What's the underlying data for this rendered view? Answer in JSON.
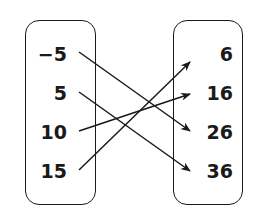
{
  "diagram": {
    "type": "mapping-diagram",
    "domain": [
      "−5",
      "5",
      "10",
      "15"
    ],
    "range": [
      "6",
      "16",
      "26",
      "36"
    ],
    "mappings": [
      {
        "from": "−5",
        "to": "26"
      },
      {
        "from": "5",
        "to": "36"
      },
      {
        "from": "10",
        "to": "16"
      },
      {
        "from": "15",
        "to": "6"
      }
    ],
    "colors": {
      "ink": "#1a1a1a",
      "background": "#ffffff"
    }
  }
}
